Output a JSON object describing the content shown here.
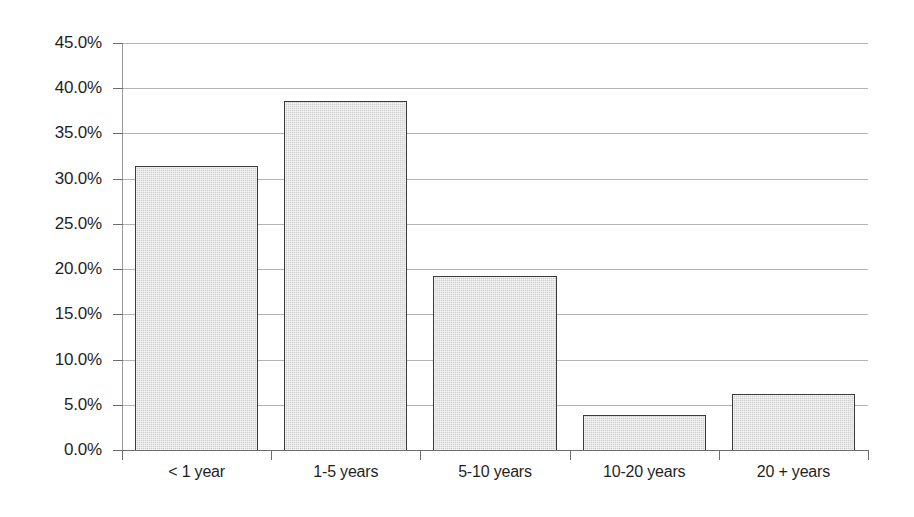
{
  "chart_data": {
    "type": "bar",
    "title": "",
    "subtitle": "",
    "xlabel": "",
    "ylabel": "",
    "categories": [
      "< 1 year",
      "1-5 years",
      "5-10 years",
      "10-20 years",
      "20 + years"
    ],
    "values": [
      31.4,
      38.6,
      19.2,
      3.9,
      6.2
    ],
    "value_labels": [
      "31.4%",
      "38.6%",
      "19.2%",
      "3.9%",
      "6.2%"
    ],
    "ylim": [
      0,
      45
    ],
    "ytick_values": [
      0,
      5,
      10,
      15,
      20,
      25,
      30,
      35,
      40,
      45
    ],
    "ytick_labels": [
      "0.0%",
      "5.0%",
      "10.0%",
      "15.0%",
      "20.0%",
      "25.0%",
      "30.0%",
      "35.0%",
      "40.0%",
      "45.0%"
    ],
    "grid": "horizontal",
    "legend": "none",
    "colors": {
      "bar_fill": "#cfcfcf",
      "bar_border": "#3b3b3b",
      "gridline": "#b3b3b3",
      "axis": "#6e6e6e",
      "background": "#ffffff",
      "text": "#1f1f1f"
    }
  },
  "axes": {
    "y": {
      "labels": [
        {
          "text": "45.0%",
          "value": 45
        },
        {
          "text": "40.0%",
          "value": 40
        },
        {
          "text": "35.0%",
          "value": 35
        },
        {
          "text": "30.0%",
          "value": 30
        },
        {
          "text": "25.0%",
          "value": 25
        },
        {
          "text": "20.0%",
          "value": 20
        },
        {
          "text": "15.0%",
          "value": 15
        },
        {
          "text": "10.0%",
          "value": 10
        },
        {
          "text": "5.0%",
          "value": 5
        },
        {
          "text": "0.0%",
          "value": 0
        }
      ]
    },
    "x": {
      "labels": [
        {
          "text": "< 1 year"
        },
        {
          "text": "1-5 years"
        },
        {
          "text": "5-10 years"
        },
        {
          "text": "10-20 years"
        },
        {
          "text": "20 + years"
        }
      ]
    }
  }
}
